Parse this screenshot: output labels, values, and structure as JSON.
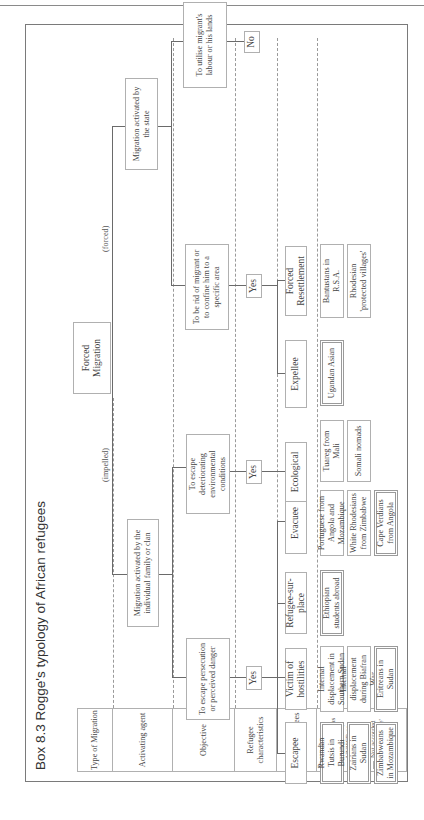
{
  "title": "Box 8.3  Rogge's typology of African refugees",
  "row_headers": [
    "Type of Migration",
    "Activating agent",
    "Objective",
    "Refugee characteristics",
    "Type of refugees"
  ],
  "legend": {
    "title": "Examples",
    "recognised": "Recognised as 'refugees' by UNHCR or OAU",
    "not_accorded": "Not accorded legal 'refugee' status"
  },
  "root": "Forced Migration",
  "branch_labels": {
    "impelled": "(impelled)",
    "forced": "(forced)"
  },
  "agents": {
    "family": "Migration activated by the individual family or clan",
    "state": "Migration activated by the state"
  },
  "objectives": {
    "persecution": "To escape persecution or perceived danger",
    "environment": "To escape deteriorating environmental conditions",
    "rid": "To be rid of migrant or to confine him to a specific area",
    "utilise": "To utilise migrant's labour or his lands"
  },
  "characteristics": {
    "yes1": "Yes",
    "yes2": "Yes",
    "yes3": "Yes",
    "no": "No"
  },
  "types": {
    "escapee": "Escapee",
    "victim": "Victim of hostilities",
    "sur_place": "Refugee-sur-place",
    "evacuee": "Evacuee",
    "ecological": "Ecological",
    "expellee": "Expellee",
    "resettlement": "Forced Resettlement"
  },
  "examples": {
    "escapee": [
      "Rwandan Tutsis in Burundi",
      "Zairians in Sudan",
      "Zimbabweans in Mozambique"
    ],
    "victim": [
      "Internal displacement in Southern Sudan",
      "Internal displacement during Biafran War",
      "Eritreans in Sudan"
    ],
    "sur_place": [
      "Ethiopian students abroad"
    ],
    "evacuee": [
      "Portuguese from Angola and Mozambique",
      "White Rhodesians from Zimbabwe",
      "Cape Verdians from Angola"
    ],
    "ecological": [
      "Tuareg from Mali",
      "Somali nomads"
    ],
    "expellee": [
      "Ugandan Asian"
    ],
    "resettlement": [
      "Bantustans in R.S.A.",
      "Rhodesian 'protected villages'"
    ]
  }
}
